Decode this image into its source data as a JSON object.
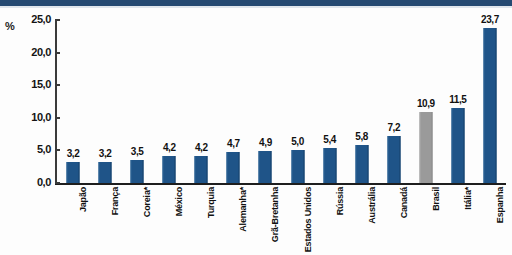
{
  "chart_data": {
    "type": "bar",
    "title": "",
    "subtitle": "",
    "xlabel": "",
    "ylabel": "%",
    "ylim": [
      0,
      25
    ],
    "grid": false,
    "legend": "none",
    "value_labels_shown": true,
    "decimal_separator": ",",
    "categories": [
      "Japão",
      "França",
      "Coreia*",
      "México",
      "Turquia",
      "Alemanha*",
      "Grã-Bretanha",
      "Estados Unidos",
      "Rússia",
      "Austrália",
      "Canadá",
      "Brasil",
      "Itália*",
      "Espanha"
    ],
    "values": [
      3.2,
      3.2,
      3.5,
      4.2,
      4.2,
      4.7,
      4.9,
      5.0,
      5.4,
      5.8,
      7.2,
      10.9,
      11.5,
      23.7
    ],
    "value_labels": [
      "3,2",
      "3,2",
      "3,5",
      "4,2",
      "4,2",
      "4,7",
      "4,9",
      "5,0",
      "5,4",
      "5,8",
      "7,2",
      "10,9",
      "11,5",
      "23,7"
    ],
    "bar_colors": [
      "#1f5488",
      "#1f5488",
      "#1f5488",
      "#1f5488",
      "#1f5488",
      "#1f5488",
      "#1f5488",
      "#1f5488",
      "#1f5488",
      "#1f5488",
      "#1f5488",
      "#9a9a9a",
      "#1f5488",
      "#1f5488"
    ],
    "highlighted_category": "Brasil",
    "yticks": [
      0,
      5,
      10,
      15,
      20,
      25
    ],
    "ytick_labels": [
      "0,0",
      "5,0",
      "10,0",
      "15,0",
      "20,0",
      "25,0"
    ]
  },
  "colors": {
    "bar_primary": "#1f5488",
    "bar_highlight": "#9a9a9a",
    "banner": "#254a72",
    "axis": "#1e1e1e",
    "text": "#111111",
    "background": "#ffffff"
  }
}
